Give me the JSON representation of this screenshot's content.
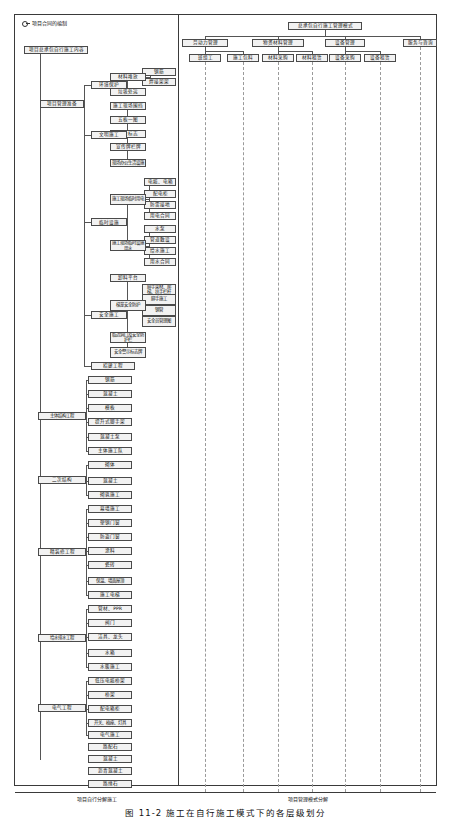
{
  "figure": {
    "caption": "图 11-2  施工在自行施工模式下的各层级划分",
    "legend_label": "项目合同的编制",
    "footer_left": "项目自行分解施工",
    "footer_right": "项目管理模式分解"
  },
  "left_tree": {
    "root": "项目总承包自行施工内容",
    "groups": [
      {
        "name": "项目管理准备",
        "children": [
          {
            "name": "环境保护",
            "children": [
              {
                "name": "材料堆放",
                "children": [
                  {
                    "name": "钢筋"
                  },
                  {
                    "name": "焊接架架"
                  }
                ]
              },
              {
                "name": "垃圾处运"
              }
            ]
          },
          {
            "name": "文明施工",
            "children": [
              {
                "name": "施工现场围挡"
              },
              {
                "name": "五板一图"
              },
              {
                "name": "企业标志"
              },
              {
                "name": "宣传牌栏牌"
              },
              {
                "name": "现场办公生活设施"
              }
            ]
          },
          {
            "name": "临时设施",
            "children": [
              {
                "name": "施工现场临时用电",
                "children": [
                  {
                    "name": "电缆、电箱"
                  },
                  {
                    "name": "配电柜"
                  },
                  {
                    "name": "防雷接地"
                  },
                  {
                    "name": "用电合同"
                  }
                ]
              },
              {
                "name": "施工现场临时设施用水",
                "children": [
                  {
                    "name": "水泵"
                  },
                  {
                    "name": "管道敷设"
                  },
                  {
                    "name": "给水施工"
                  },
                  {
                    "name": "用水合同"
                  }
                ]
              }
            ]
          },
          {
            "name": "安全施工",
            "children": [
              {
                "name": "卸料平台"
              },
              {
                "name": "梯笼安全防护",
                "children": [
                  {
                    "name": "脚手架材、爬梯、扶手栏杆"
                  },
                  {
                    "name": "脚手施工"
                  },
                  {
                    "name": "钢管"
                  },
                  {
                    "name": "安全员管理图"
                  }
                ]
              },
              {
                "name": "临边洞口及安全防护栏"
              },
              {
                "name": "安全警示标志牌"
              }
            ]
          },
          {
            "name": "招建工程"
          }
        ]
      },
      {
        "name": "主体结构工程",
        "children": [
          {
            "name": "钢筋"
          },
          {
            "name": "混凝土"
          },
          {
            "name": "模板"
          },
          {
            "name": "提升式脚手架"
          },
          {
            "name": "混凝土泵"
          },
          {
            "name": "主体施工队"
          }
        ]
      },
      {
        "name": "二次结构",
        "children": [
          {
            "name": "砌体"
          },
          {
            "name": "混凝土"
          },
          {
            "name": "砌筑施工"
          }
        ]
      },
      {
        "name": "精装修工程",
        "children": [
          {
            "name": "幕墙施工"
          },
          {
            "name": "塑钢门窗"
          },
          {
            "name": "防盗门窗"
          },
          {
            "name": "涂料"
          },
          {
            "name": "瓷砖"
          },
          {
            "name": "保温、墙面屋顶"
          },
          {
            "name": "施工电梯"
          }
        ]
      },
      {
        "name": "给水排水工程",
        "children": [
          {
            "name": "管材、PPR"
          },
          {
            "name": "阀门"
          },
          {
            "name": "洁具、龙头"
          },
          {
            "name": "水箱"
          },
          {
            "name": "水暖施工"
          }
        ]
      },
      {
        "name": "电气工程",
        "children": [
          {
            "name": "低压电缆桥架"
          },
          {
            "name": "桥架"
          },
          {
            "name": "配电箱柜"
          },
          {
            "name": "开关、插座、灯具"
          },
          {
            "name": "电气施工"
          }
        ]
      },
      {
        "name": "道路工程",
        "children": [
          {
            "name": "路配石"
          },
          {
            "name": "混凝土"
          },
          {
            "name": "沥青混凝土"
          },
          {
            "name": "路缘石"
          },
          {
            "name": "道路施工"
          }
        ]
      },
      {
        "name": "保洁",
        "children": []
      }
    ]
  },
  "right_matrix": {
    "root": "总承包自行施工管理模式",
    "categories": [
      {
        "name": "劳动力管理",
        "columns": [
          {
            "name": "班组工"
          },
          {
            "name": "施工包料"
          }
        ]
      },
      {
        "name": "物资材料管理",
        "columns": [
          {
            "name": "材料采购"
          },
          {
            "name": "材料租赁"
          }
        ]
      },
      {
        "name": "设备管理",
        "columns": [
          {
            "name": "设备采购"
          },
          {
            "name": "设备租赁"
          }
        ]
      },
      {
        "name": "服务与咨询",
        "columns": []
      }
    ],
    "column_keys": [
      "班组工",
      "施工包料",
      "材料采购",
      "材料租赁",
      "设备采购",
      "设备租赁",
      "服务与咨询"
    ]
  },
  "mappings": [
    {
      "item": "钢筋",
      "y": 72,
      "cols": [
        2
      ]
    },
    {
      "item": "焊接架架",
      "y": 82,
      "cols": [
        1
      ]
    },
    {
      "item": "垃圾处运",
      "y": 92,
      "cols": [
        0
      ]
    },
    {
      "item": "施工现场围挡",
      "y": 106,
      "cols": [
        1
      ]
    },
    {
      "item": "五板一图",
      "y": 120,
      "cols": [
        2
      ]
    },
    {
      "item": "企业标志",
      "y": 134,
      "cols": [
        2
      ]
    },
    {
      "item": "宣传牌栏牌",
      "y": 147,
      "cols": [
        2
      ]
    },
    {
      "item": "现场办公生活设施",
      "y": 163,
      "cols": [
        1
      ]
    },
    {
      "item": "电缆、电箱",
      "y": 182,
      "cols": [
        2
      ]
    },
    {
      "item": "配电柜",
      "y": 194,
      "cols": [
        4
      ]
    },
    {
      "item": "防雷接地",
      "y": 205,
      "cols": [
        1
      ]
    },
    {
      "item": "用电合同",
      "y": 216,
      "cols": [
        6
      ]
    },
    {
      "item": "水泵",
      "y": 229,
      "cols": [
        4
      ]
    },
    {
      "item": "管道敷设",
      "y": 240,
      "cols": [
        2
      ]
    },
    {
      "item": "给水施工",
      "y": 251,
      "cols": [
        1
      ]
    },
    {
      "item": "用水合同",
      "y": 262,
      "cols": [
        6
      ]
    },
    {
      "item": "脚手架材、爬梯、扶手栏杆",
      "y": 278,
      "cols": [
        2
      ]
    },
    {
      "item": "脚手施工",
      "y": 289,
      "cols": [
        1
      ]
    },
    {
      "item": "钢管",
      "y": 299,
      "cols": [
        3
      ]
    },
    {
      "item": "安全员管理图",
      "y": 310,
      "cols": [
        1
      ]
    },
    {
      "item": "安全警示标志牌",
      "y": 321,
      "cols": [
        2
      ]
    },
    {
      "item": "招建工程",
      "y": 337,
      "cols": [
        1
      ]
    },
    {
      "item": "钢筋",
      "y": 352,
      "cols": [
        2
      ]
    },
    {
      "item": "混凝土",
      "y": 366,
      "cols": [
        2
      ]
    },
    {
      "item": "模板",
      "y": 380,
      "cols": [
        2
      ]
    },
    {
      "item": "提升式脚手架",
      "y": 394,
      "cols": [
        5
      ]
    },
    {
      "item": "混凝土泵",
      "y": 408,
      "cols": [
        5
      ]
    },
    {
      "item": "主体施工队",
      "y": 422,
      "cols": [
        1
      ]
    },
    {
      "item": "砌体",
      "y": 437,
      "cols": [
        2
      ]
    },
    {
      "item": "混凝土",
      "y": 451,
      "cols": [
        2
      ]
    },
    {
      "item": "砌筑施工",
      "y": 465,
      "cols": [
        1
      ]
    },
    {
      "item": "幕墙施工",
      "y": 481,
      "cols": [
        1
      ]
    },
    {
      "item": "塑钢门窗",
      "y": 495,
      "cols": [
        2
      ]
    },
    {
      "item": "防盗门窗",
      "y": 509,
      "cols": [
        2
      ]
    },
    {
      "item": "涂料",
      "y": 523,
      "cols": [
        2
      ]
    },
    {
      "item": "瓷砖",
      "y": 537,
      "cols": [
        2
      ]
    },
    {
      "item": "保温、墙面屋顶",
      "y": 551,
      "cols": [
        2
      ]
    },
    {
      "item": "施工电梯",
      "y": 565,
      "cols": [
        5
      ]
    },
    {
      "item": "管材、PPR",
      "y": 581,
      "cols": [
        2
      ]
    },
    {
      "item": "阀门",
      "y": 595,
      "cols": [
        3
      ]
    },
    {
      "item": "洁具、龙头",
      "y": 609,
      "cols": [
        3
      ]
    },
    {
      "item": "水箱",
      "y": 623,
      "cols": [
        2
      ]
    },
    {
      "item": "水暖施工",
      "y": 637,
      "cols": [
        1
      ]
    },
    {
      "item": "低压电缆桥架",
      "y": 653,
      "cols": [
        2
      ]
    },
    {
      "item": "桥架",
      "y": 667,
      "cols": [
        3
      ]
    },
    {
      "item": "配电箱柜",
      "y": 681,
      "cols": [
        3
      ]
    },
    {
      "item": "开关、插座、灯具",
      "y": 695,
      "cols": [
        3
      ]
    },
    {
      "item": "电气施工",
      "y": 709,
      "cols": [
        1
      ]
    },
    {
      "item": "路配石",
      "y": 723,
      "cols": [
        2
      ]
    },
    {
      "item": "混凝土",
      "y": 735,
      "cols": [
        2
      ]
    },
    {
      "item": "沥青混凝土",
      "y": 747,
      "cols": [
        2
      ]
    },
    {
      "item": "路缘石",
      "y": 759,
      "cols": [
        2
      ]
    },
    {
      "item": "道路施工",
      "y": 771,
      "cols": [
        1
      ]
    },
    {
      "item": "保洁",
      "y": 784,
      "cols": [
        6
      ]
    }
  ]
}
